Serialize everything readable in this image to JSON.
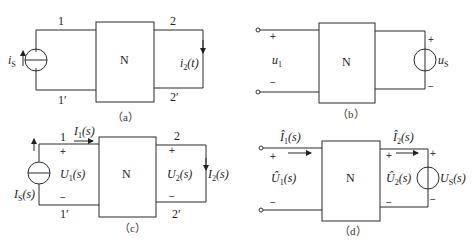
{
  "figure": {
    "network_label": "N",
    "panels": [
      {
        "id": "a",
        "caption": "（a）",
        "source": {
          "type": "current-source",
          "label": "i",
          "label_sub": "S",
          "direction": "up"
        },
        "terminals": {
          "top_left": "1",
          "bottom_left": "1′",
          "top_right": "2",
          "bottom_right": "2′"
        },
        "output": {
          "label": "i",
          "label_sub": "2",
          "label_suffix": "(t)",
          "direction": "down"
        }
      },
      {
        "id": "b",
        "caption": "（b）",
        "port1": {
          "label": "u",
          "label_sub": "1",
          "plus": "+",
          "minus": "−"
        },
        "source": {
          "type": "voltage-source",
          "label": "u",
          "label_sub": "S",
          "plus": "+",
          "minus": "−"
        }
      },
      {
        "id": "c",
        "caption": "（c）",
        "source": {
          "type": "current-source",
          "label": "I",
          "label_sub": "S",
          "label_suffix": "(s)",
          "direction": "up"
        },
        "terminals": {
          "top_left": "1",
          "bottom_left": "1′",
          "top_right": "2",
          "bottom_right": "2′"
        },
        "port1": {
          "current": "I",
          "current_sub": "1",
          "current_suffix": "(s)",
          "voltage": "U",
          "voltage_sub": "1",
          "voltage_suffix": "(s)",
          "plus": "+",
          "minus": "−"
        },
        "port2": {
          "voltage": "U",
          "voltage_sub": "2",
          "voltage_suffix": "(s)",
          "current": "I",
          "current_sub": "2",
          "current_suffix": "(s)",
          "plus": "+",
          "minus": "−"
        }
      },
      {
        "id": "d",
        "caption": "（d）",
        "port1": {
          "current": "Î",
          "current_sub": "1",
          "current_suffix": "(s)",
          "voltage": "Û",
          "voltage_sub": "1",
          "voltage_suffix": "(s)",
          "plus": "+",
          "minus": "−"
        },
        "port2": {
          "current": "Î",
          "current_sub": "2",
          "current_suffix": "(s)",
          "voltage": "Û",
          "voltage_sub": "2",
          "voltage_suffix": "(s)",
          "plus": "+",
          "minus": "−"
        },
        "source": {
          "type": "voltage-source",
          "label": "U",
          "label_sub": "S",
          "label_suffix": "(s)",
          "plus": "+",
          "minus": "−"
        }
      }
    ]
  }
}
